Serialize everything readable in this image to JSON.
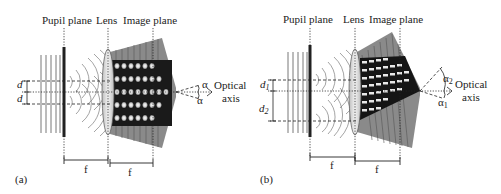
{
  "panels": [
    {
      "id": "a",
      "caption": "(a)",
      "labels": {
        "pupil_plane": "Pupil plane",
        "lens": "Lens",
        "image_plane": "Image plane",
        "optical": "Optical",
        "axis": "axis",
        "focal_1": "f",
        "focal_2": "f",
        "d_upper": "d",
        "d_lower": "d",
        "angle_upper": "α",
        "angle_lower": "α"
      }
    },
    {
      "id": "b",
      "caption": "(b)",
      "labels": {
        "pupil_plane": "Pupil plane",
        "lens": "Lens",
        "image_plane": "Image plane",
        "optical": "Optical",
        "axis": "axis",
        "focal_1": "f",
        "focal_2": "f",
        "d_upper": "d",
        "d_upper_sub": "1",
        "d_lower": "d",
        "d_lower_sub": "2",
        "angle_upper": "α",
        "angle_upper_sub": "2",
        "angle_lower": "α",
        "angle_lower_sub": "1"
      }
    }
  ],
  "colors": {
    "ink": "#222222",
    "fringe_gray": "#8a8a8a",
    "lens_fill": "#e6e6e6",
    "dark": "#111111"
  }
}
